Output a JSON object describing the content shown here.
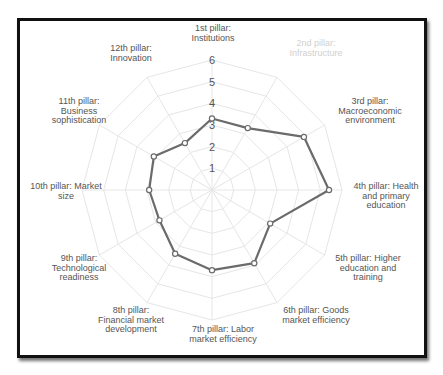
{
  "chart_data": {
    "type": "radar",
    "title": "",
    "categories": [
      "1st pillar: Institutions",
      "2nd pillar: Infrastructure",
      "3rd pillar: Macroeconomic environment",
      "4th pillar: Health and primary education",
      "5th pillar: Higher education and training",
      "6th pillar: Goods market efficiency",
      "7th pillar: Labor market efficiency",
      "8th pillar: Financial market development",
      "9th pillar: Technological readiness",
      "10th pillar: Market size",
      "11th pillar: Business sophistication",
      "12th pillar: Innovation"
    ],
    "label_lines": [
      [
        "1st pillar:",
        "Institutions"
      ],
      [
        "2nd pillar:",
        "Infrastructure"
      ],
      [
        "3rd pillar:",
        "Macroeconomic",
        "environment"
      ],
      [
        "4th pillar: Health",
        "and primary",
        "education"
      ],
      [
        "5th pillar: Higher",
        "education and",
        "training"
      ],
      [
        "6th pillar: Goods",
        "market efficiency"
      ],
      [
        "7th pillar: Labor",
        "market efficiency"
      ],
      [
        "8th pillar:",
        "Financial market",
        "development"
      ],
      [
        "9th pillar:",
        "Technological",
        "readiness"
      ],
      [
        "10th pillar: Market",
        "size"
      ],
      [
        "11th pillar:",
        "Business",
        "sophistication"
      ],
      [
        "12th pillar:",
        "Innovation"
      ]
    ],
    "series": [
      {
        "name": "Score",
        "values": [
          3.3,
          3.3,
          4.9,
          5.4,
          3.1,
          3.9,
          3.7,
          3.4,
          2.8,
          2.9,
          3.1,
          2.5
        ]
      }
    ],
    "radial_ticks": [
      1,
      2,
      3,
      4,
      5,
      6
    ],
    "rlim": [
      0,
      6
    ],
    "grid": true,
    "legend": "none",
    "faded_label_index": 1,
    "colors": {
      "series": "#6b6b6b",
      "grid": "#e6e6e6",
      "text": "#555555",
      "faded_text": "#d0d0d0",
      "frame": "#111111"
    }
  }
}
